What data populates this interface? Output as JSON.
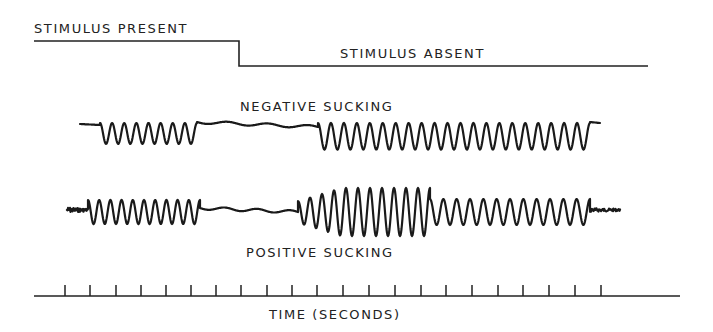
{
  "figure": {
    "stimulus": {
      "present_label": "STIMULUS PRESENT",
      "absent_label": "STIMULUS ABSENT",
      "line": {
        "x_start": 34,
        "x_step": 239,
        "x_end": 648,
        "y_high": 41,
        "y_low": 66
      }
    },
    "negative_trace": {
      "label": "NEGATIVE SUCKING",
      "baseline_y": 125,
      "segments": [
        {
          "type": "flat",
          "x0": 80,
          "x1": 100,
          "y0": 124,
          "y1": 125
        },
        {
          "type": "osc",
          "x0": 100,
          "x1": 197,
          "cycles": 8,
          "amp": 11,
          "offset": 11,
          "invert": true
        },
        {
          "type": "flat",
          "x0": 197,
          "x1": 318,
          "y0": 122,
          "y1": 127,
          "wobble": 1.5
        },
        {
          "type": "osc",
          "x0": 318,
          "x1": 590,
          "cycles": 21,
          "amp": 14,
          "offset": 14,
          "invert": true
        },
        {
          "type": "flat",
          "x0": 590,
          "x1": 600,
          "y0": 122,
          "y1": 123
        }
      ]
    },
    "positive_trace": {
      "label": "POSITIVE SUCKING",
      "baseline_y": 212,
      "segments": [
        {
          "type": "noise",
          "x0": 67,
          "x1": 88,
          "y0": 210,
          "amp": 4
        },
        {
          "type": "osc",
          "x0": 88,
          "x1": 200,
          "cycles": 10,
          "amp": 12,
          "offset": 0,
          "invert": true
        },
        {
          "type": "flat",
          "x0": 200,
          "x1": 298,
          "y0": 208,
          "y1": 212,
          "wobble": 1.5
        },
        {
          "type": "osc",
          "x0": 298,
          "x1": 430,
          "cycles": 11,
          "amp": 24,
          "offset": 0,
          "invert": true,
          "ramp": true
        },
        {
          "type": "osc",
          "x0": 430,
          "x1": 590,
          "cycles": 12,
          "amp": 13,
          "offset": 0,
          "invert": true
        },
        {
          "type": "noise",
          "x0": 590,
          "x1": 620,
          "y0": 210,
          "amp": 3
        }
      ]
    },
    "time_axis": {
      "label": "TIME (SECONDS)",
      "baseline_y": 296,
      "x_start": 34,
      "x_end": 680,
      "tick_top_y": 285,
      "tick_x": [
        65,
        90,
        116,
        141,
        166,
        191,
        216,
        241,
        267,
        292,
        317,
        343,
        369,
        395,
        421,
        446,
        472,
        498,
        523,
        549,
        575,
        601
      ]
    }
  }
}
